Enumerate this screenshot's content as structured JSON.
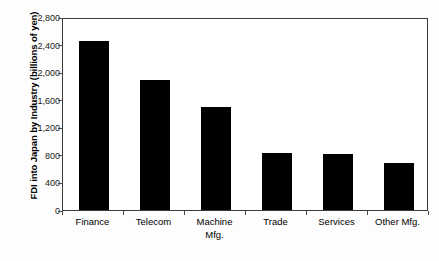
{
  "chart_data": {
    "type": "bar",
    "title": "",
    "xlabel": "",
    "ylabel": "FDI into Japan by Industry (billions of yen)",
    "ylim": [
      0,
      2800
    ],
    "yticks": [
      "0",
      "400",
      "800",
      "1,200",
      "1,600",
      "2,000",
      "2,400",
      "2,800"
    ],
    "ytick_values": [
      0,
      400,
      800,
      1200,
      1600,
      2000,
      2400,
      2800
    ],
    "grid": false,
    "legend": "none",
    "bar_color": "#000000",
    "categories": [
      "Finance",
      "Telecom",
      "Machine Mfg.",
      "Trade",
      "Services",
      "Other Mfg."
    ],
    "category_lines": [
      [
        "Finance",
        ""
      ],
      [
        "Telecom",
        ""
      ],
      [
        "Machine",
        "Mfg."
      ],
      [
        "Trade",
        ""
      ],
      [
        "Services",
        ""
      ],
      [
        "Other Mfg.",
        ""
      ]
    ],
    "values": [
      2450,
      1890,
      1490,
      820,
      810,
      680
    ]
  }
}
